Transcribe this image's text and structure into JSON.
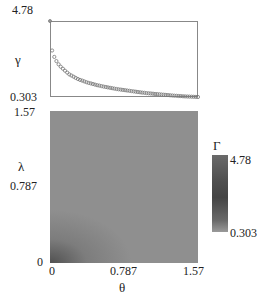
{
  "chart_data": [
    {
      "type": "scatter",
      "title": "",
      "xlabel": "",
      "ylabel": "γ",
      "ylim": [
        0.303,
        4.78
      ],
      "y_ticks": [
        "4.78",
        "0.303"
      ],
      "marker": "open-circle",
      "description": "Monotonically decaying curve of γ vs θ (shares x-axis with heatmap below, 0 to 1.57)",
      "x": [
        0.0,
        0.01,
        0.03,
        0.05,
        0.08,
        0.12,
        0.16,
        0.2,
        0.3,
        0.4,
        0.5,
        0.6,
        0.7,
        0.8,
        0.9,
        1.0,
        1.1,
        1.2,
        1.3,
        1.4,
        1.5,
        1.57
      ],
      "values": [
        4.78,
        3.3,
        2.9,
        2.6,
        2.3,
        2.05,
        1.85,
        1.65,
        1.35,
        1.15,
        1.0,
        0.88,
        0.78,
        0.7,
        0.62,
        0.55,
        0.49,
        0.44,
        0.39,
        0.35,
        0.32,
        0.303
      ]
    },
    {
      "type": "heatmap",
      "title": "",
      "xlabel": "θ",
      "ylabel": "λ",
      "xlim": [
        0,
        1.57
      ],
      "ylim": [
        0,
        1.57
      ],
      "x_ticks": [
        "0",
        "0.787",
        "1.57"
      ],
      "y_ticks": [
        "0",
        "0.787",
        "1.57"
      ],
      "colorbar": {
        "label": "Γ",
        "min": 0.303,
        "max": 4.78,
        "ticks": [
          "4.78",
          "0.303"
        ]
      },
      "description": "Nearly uniform medium-gray field; darker region in lower-left corner near θ=0, λ=0"
    }
  ],
  "top": {
    "ylabel": "γ",
    "ytick_max": "4.78",
    "ytick_min": "0.303"
  },
  "heat": {
    "ylabel": "λ",
    "xlabel": "θ",
    "ytick_top": "1.57",
    "ytick_mid": "0.787",
    "ytick_bot": "0",
    "xtick_left": "0",
    "xtick_mid": "0.787",
    "xtick_right": "1.57"
  },
  "cbar": {
    "label": "Γ",
    "max": "4.78",
    "min": "0.303"
  }
}
